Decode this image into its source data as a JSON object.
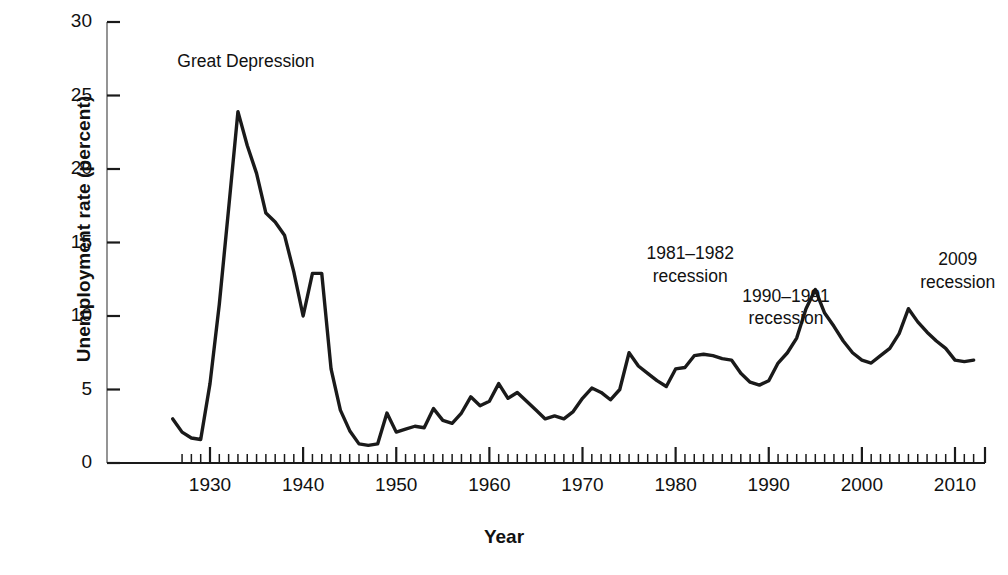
{
  "chart_data": {
    "type": "line",
    "title": "",
    "xlabel": "Year",
    "ylabel": "Unemployment rate (percent)",
    "xlim": [
      1926,
      2012
    ],
    "ylim": [
      0,
      30
    ],
    "grid": false,
    "legend": "none",
    "line_color": "#1a1a1a",
    "y_ticks": [
      0,
      5,
      10,
      15,
      20,
      25,
      30
    ],
    "y_tick_labels": [
      "0",
      "5",
      "10",
      "15",
      "20",
      "25",
      "30"
    ],
    "x_ticks": [
      1930,
      1940,
      1950,
      1960,
      1970,
      1980,
      1990,
      2000,
      2010
    ],
    "x_tick_labels": [
      "1930",
      "1940",
      "1950",
      "1960",
      "1970",
      "1980",
      "1990",
      "2000",
      "2010"
    ],
    "x_minor_tick_step": 1,
    "series": [
      {
        "name": "Unemployment rate",
        "x": [
          1926,
          1927,
          1928,
          1929,
          1930,
          1931,
          1932,
          1933,
          1934,
          1935,
          1936,
          1937,
          1938,
          1939,
          1940,
          1941,
          1942,
          1943,
          1944,
          1945,
          1946,
          1947,
          1948,
          1949,
          1950,
          1951,
          1952,
          1953,
          1954,
          1955,
          1956,
          1957,
          1958,
          1959,
          1960,
          1961,
          1962,
          1963,
          1964,
          1965,
          1966,
          1967,
          1968,
          1969,
          1970,
          1971,
          1972,
          1973,
          1974,
          1975,
          1976,
          1977,
          1978,
          1979,
          1980,
          1981,
          1982,
          1983,
          1984,
          1985,
          1986,
          1987,
          1988,
          1989,
          1990,
          1991,
          1992,
          1993,
          1994,
          1995,
          1996,
          1997,
          1998,
          1999,
          2000,
          2001,
          2002,
          2003,
          2004,
          2005,
          2006,
          2007,
          2008,
          2009,
          2010,
          2011,
          2012
        ],
        "values": [
          3.0,
          2.1,
          1.7,
          1.6,
          5.4,
          10.8,
          17.3,
          23.9,
          21.6,
          19.7,
          17.0,
          16.4,
          15.5,
          13.0,
          10.0,
          12.9,
          12.9,
          6.4,
          3.6,
          2.2,
          1.3,
          1.2,
          1.3,
          3.4,
          2.1,
          2.3,
          2.5,
          2.4,
          3.7,
          2.9,
          2.7,
          3.4,
          4.5,
          3.9,
          4.2,
          5.4,
          4.4,
          4.8,
          4.2,
          3.6,
          3.0,
          3.2,
          3.0,
          3.5,
          4.4,
          5.1,
          4.8,
          4.3,
          5.0,
          7.5,
          6.6,
          6.1,
          5.6,
          5.2,
          6.4,
          6.5,
          7.3,
          7.4,
          7.3,
          7.1,
          7.0,
          6.1,
          5.5,
          5.3,
          5.6,
          6.8,
          7.5,
          8.5,
          10.5,
          11.8,
          10.2,
          9.3,
          8.3,
          7.5,
          7.0,
          6.8,
          7.3,
          7.8,
          8.8,
          10.5,
          9.6,
          8.9,
          8.3,
          7.8,
          7.0,
          6.9,
          7.0
        ]
      }
    ],
    "annotations": [
      {
        "id": "great-depression",
        "text": "Great Depression",
        "year": 1933,
        "value": 23.9
      },
      {
        "id": "recession-1981-1982",
        "text": "1981–1982\nrecession",
        "year": 1982,
        "value": 9.7
      },
      {
        "id": "recession-1990-1991",
        "text": "1990–1991\nrecession",
        "year": 1991,
        "value": 6.8
      },
      {
        "id": "recession-2009",
        "text": "2009\nrecession",
        "year": 2009,
        "value": 9.3
      }
    ]
  }
}
